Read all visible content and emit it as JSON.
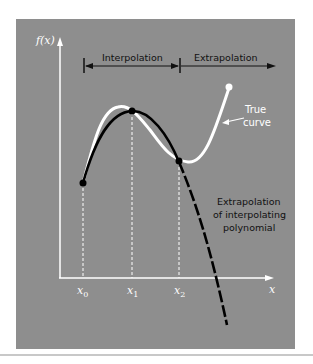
{
  "figure": {
    "y_axis_label": "f(x)",
    "x_axis_label": "x",
    "x_ticks": [
      {
        "base": "x",
        "sub": "0"
      },
      {
        "base": "x",
        "sub": "1"
      },
      {
        "base": "x",
        "sub": "2"
      }
    ],
    "regions": {
      "interpolation": "Interpolation",
      "extrapolation": "Extrapolation"
    },
    "annotations": {
      "true_curve_line1": "True",
      "true_curve_line2": "curve",
      "extrap_line1": "Extrapolation",
      "extrap_line2": "of interpolating",
      "extrap_line3": "polynomial"
    },
    "colors": {
      "panel": "#8e8e8e",
      "true_curve": "#ffffff",
      "polynomial": "#000000"
    }
  }
}
